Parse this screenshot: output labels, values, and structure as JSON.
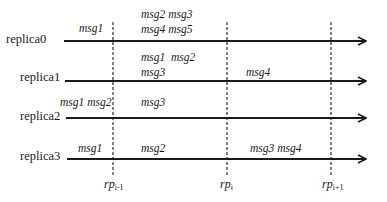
{
  "diagram": {
    "replicas": [
      {
        "label": "replica0",
        "y": 41,
        "x_start": 64,
        "messages": [
          {
            "text": "msg1",
            "x": 83,
            "y": 23
          },
          {
            "text": "msg2 msg3",
            "x": 141,
            "y": 9
          },
          {
            "text": "msg4 msg5",
            "x": 141,
            "y": 24
          }
        ]
      },
      {
        "label": "replica1",
        "y": 81,
        "x_start": 65,
        "messages": [
          {
            "text": "msg1  msg2",
            "x": 141,
            "y": 52
          },
          {
            "text": "msg3",
            "x": 141,
            "y": 67
          },
          {
            "text": "msg4",
            "x": 246,
            "y": 67
          }
        ]
      },
      {
        "label": "replica2",
        "y": 118,
        "x_start": 66,
        "messages": [
          {
            "text": "msg1 msg2",
            "x": 60,
            "y": 97
          },
          {
            "text": "msg3",
            "x": 141,
            "y": 97
          }
        ]
      },
      {
        "label": "replica3",
        "y": 159,
        "x_start": 67,
        "messages": [
          {
            "text": "msg1",
            "x": 78,
            "y": 143
          },
          {
            "text": "msg2",
            "x": 141,
            "y": 143
          },
          {
            "text": "msg3 msg4",
            "x": 250,
            "y": 143
          }
        ]
      }
    ],
    "replica_labels": [
      "replica0",
      "replica1",
      "replica2",
      "replica3"
    ],
    "messages": {
      "r0_a": "msg1",
      "r0_b": "msg2 msg3",
      "r0_c": "msg4 msg5",
      "r1_a": "msg1  msg2",
      "r1_b": "msg3",
      "r1_c": "msg4",
      "r2_a": "msg1 msg2",
      "r2_b": "msg3",
      "r3_a": "msg1",
      "r3_b": "msg2",
      "r3_c": "msg3 msg4"
    },
    "arrow_end_x": 366,
    "checkpoints": [
      {
        "base": "rp",
        "sub": "i-1",
        "x": 113
      },
      {
        "base": "rp",
        "sub": "i",
        "x": 227
      },
      {
        "base": "rp",
        "sub": "i+1",
        "x": 331
      }
    ],
    "colors": {
      "line": "#1a1a1a",
      "background": "#ffffff"
    }
  }
}
